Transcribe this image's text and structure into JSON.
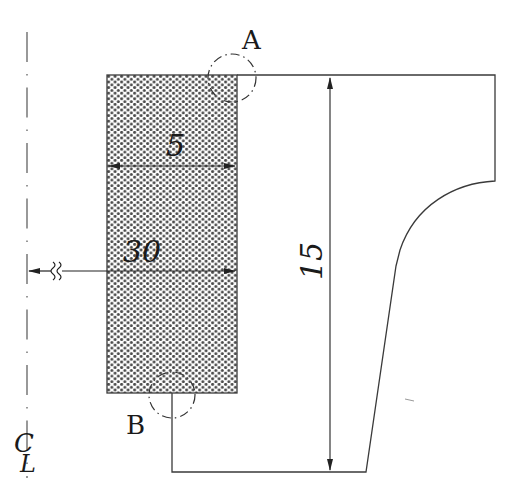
{
  "diagram": {
    "type": "engineering cross-section drawing",
    "colors": {
      "line": "#3a3a3a",
      "hatch_dot": "#4a4a4a",
      "hatch_bg": "#ffffff",
      "text": "#1a1a1a"
    },
    "centerline": {
      "symbol": "CL",
      "symbol_parts": [
        "C",
        "L"
      ]
    },
    "detail_labels": {
      "a": "A",
      "b": "B"
    },
    "dimensions": {
      "width": "5",
      "radius_from_centerline": "30",
      "height": "15"
    },
    "regions": {
      "hatched_block": "dotted (hatched) rectangular block",
      "outline_profile": "stepped profile with concave arc"
    },
    "symbols": {
      "break": "≈ break symbol on dimension line"
    }
  }
}
